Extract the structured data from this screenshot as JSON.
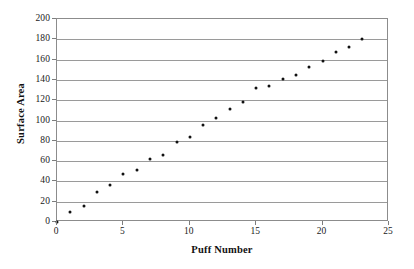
{
  "chart_data": {
    "type": "scatter",
    "title": "",
    "xlabel": "Puff Number",
    "ylabel": "Surface Area",
    "xlim": [
      0,
      25
    ],
    "ylim": [
      0,
      200
    ],
    "xticks": [
      0,
      5,
      10,
      15,
      20,
      25
    ],
    "yticks": [
      0,
      20,
      40,
      60,
      80,
      100,
      120,
      140,
      160,
      180,
      200
    ],
    "xtick_labels": [
      "0",
      "5",
      "10",
      "15",
      "20",
      "25"
    ],
    "ytick_labels": [
      "0",
      "20",
      "40",
      "60",
      "80",
      "100",
      "120",
      "140",
      "160",
      "180",
      "200"
    ],
    "grid": "horizontal",
    "legend": "none",
    "marker_color": "#111111",
    "gridline_color": "#9a9a9a",
    "frame_color": "#8c8c8c",
    "background_color": "#ffffff",
    "x": [
      0,
      1,
      2,
      3,
      4,
      5,
      6,
      7,
      8,
      9,
      10,
      11,
      12,
      13,
      14,
      15,
      16,
      17,
      18,
      19,
      20,
      21,
      22,
      23
    ],
    "y": [
      0,
      10,
      16,
      30,
      36,
      47,
      51,
      62,
      66,
      79,
      84,
      96,
      102,
      111,
      118,
      132,
      134,
      141,
      145,
      153,
      159,
      167,
      172,
      180
    ],
    "points": [
      {
        "x": 0,
        "y": 0
      },
      {
        "x": 1,
        "y": 10
      },
      {
        "x": 2,
        "y": 16
      },
      {
        "x": 3,
        "y": 30
      },
      {
        "x": 4,
        "y": 36
      },
      {
        "x": 5,
        "y": 47
      },
      {
        "x": 6,
        "y": 51
      },
      {
        "x": 7,
        "y": 62
      },
      {
        "x": 8,
        "y": 66
      },
      {
        "x": 9,
        "y": 79
      },
      {
        "x": 10,
        "y": 84
      },
      {
        "x": 11,
        "y": 96
      },
      {
        "x": 12,
        "y": 102
      },
      {
        "x": 13,
        "y": 111
      },
      {
        "x": 14,
        "y": 118
      },
      {
        "x": 15,
        "y": 132
      },
      {
        "x": 16,
        "y": 134
      },
      {
        "x": 17,
        "y": 141
      },
      {
        "x": 18,
        "y": 145
      },
      {
        "x": 19,
        "y": 153
      },
      {
        "x": 20,
        "y": 159
      },
      {
        "x": 21,
        "y": 167
      },
      {
        "x": 22,
        "y": 172
      },
      {
        "x": 23,
        "y": 180
      }
    ]
  }
}
